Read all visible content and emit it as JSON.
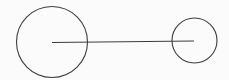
{
  "diagram": {
    "width": 229,
    "height": 80,
    "background": "#fbfbfb",
    "stroke_color": "#3c3c3c",
    "stroke_width": 1.1,
    "shapes": [
      {
        "type": "circle",
        "name": "large-circle",
        "cx": 52,
        "cy": 42,
        "r": 35.5
      },
      {
        "type": "circle",
        "name": "small-circle",
        "cx": 194.5,
        "cy": 40.5,
        "r": 22.5
      },
      {
        "type": "line",
        "name": "connector-line",
        "x1": 52,
        "y1": 42.5,
        "x2": 194,
        "y2": 41
      }
    ]
  }
}
